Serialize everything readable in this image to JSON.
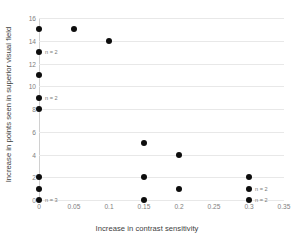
{
  "chart_data": {
    "type": "scatter",
    "title": "",
    "xlabel": "Increase in contrast sensitivity",
    "ylabel": "Increase in points seen in superior visual field",
    "xlim": [
      0,
      0.35
    ],
    "ylim": [
      0,
      16
    ],
    "xticks": [
      "0",
      "0.05",
      "0.1",
      "0.15",
      "0.2",
      "0.25",
      "0.3",
      "0.35"
    ],
    "xtick_values": [
      0,
      0.05,
      0.1,
      0.15,
      0.2,
      0.25,
      0.3,
      0.35
    ],
    "yticks": [
      "0",
      "2",
      "4",
      "6",
      "8",
      "10",
      "12",
      "14",
      "16"
    ],
    "ytick_values": [
      0,
      2,
      4,
      6,
      8,
      10,
      12,
      14,
      16
    ],
    "grid": "horizontal",
    "legend": "none",
    "marker_color": "#0d0d0d",
    "gridline_color": "#e8e8e8",
    "background_color": "#ffffff",
    "points": [
      {
        "x": 0.0,
        "y": 15,
        "note": ""
      },
      {
        "x": 0.05,
        "y": 15,
        "note": ""
      },
      {
        "x": 0.1,
        "y": 14,
        "note": ""
      },
      {
        "x": 0.0,
        "y": 13,
        "note": "n = 2"
      },
      {
        "x": 0.0,
        "y": 11,
        "note": ""
      },
      {
        "x": 0.0,
        "y": 9,
        "note": "n = 2"
      },
      {
        "x": 0.0,
        "y": 8,
        "note": ""
      },
      {
        "x": 0.15,
        "y": 5,
        "note": ""
      },
      {
        "x": 0.2,
        "y": 4,
        "note": ""
      },
      {
        "x": 0.0,
        "y": 2,
        "note": ""
      },
      {
        "x": 0.15,
        "y": 2,
        "note": ""
      },
      {
        "x": 0.3,
        "y": 2,
        "note": ""
      },
      {
        "x": 0.0,
        "y": 1,
        "note": ""
      },
      {
        "x": 0.2,
        "y": 1,
        "note": ""
      },
      {
        "x": 0.3,
        "y": 1,
        "note": "n = 2"
      },
      {
        "x": 0.0,
        "y": 0,
        "note": "n = 3"
      },
      {
        "x": 0.15,
        "y": 0,
        "note": ""
      },
      {
        "x": 0.3,
        "y": 0,
        "note": "n = 2"
      }
    ]
  }
}
